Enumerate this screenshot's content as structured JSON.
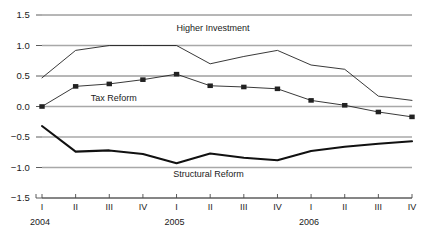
{
  "chart_data": {
    "type": "line",
    "title": "",
    "xlabel": "",
    "ylabel": "",
    "ylim": [
      -1.5,
      1.5
    ],
    "yticks": [
      "1.5",
      "1.0",
      "0.5",
      "0.0",
      "−0.5",
      "−1.0",
      "−1.5"
    ],
    "ytick_values": [
      1.5,
      1.0,
      0.5,
      0.0,
      -0.5,
      -1.0,
      -1.5
    ],
    "grid": true,
    "legend_position": "inline-annotations",
    "categories": [
      "I",
      "II",
      "III",
      "IV",
      "I",
      "II",
      "III",
      "IV",
      "I",
      "II",
      "III",
      "IV"
    ],
    "year_groups": [
      {
        "year": "2004",
        "start_index": 0,
        "end_index": 3
      },
      {
        "year": "2005",
        "start_index": 4,
        "end_index": 7
      },
      {
        "year": "2006",
        "start_index": 8,
        "end_index": 11
      }
    ],
    "series": [
      {
        "name": "Higher Investment",
        "style": "thin-line",
        "markers": false,
        "color": "#222222",
        "values": [
          0.47,
          0.92,
          1.0,
          1.0,
          1.0,
          0.7,
          0.82,
          0.92,
          0.68,
          0.61,
          0.17,
          0.1
        ]
      },
      {
        "name": "Tax Reform",
        "style": "thin-line-with-square-markers",
        "markers": true,
        "color": "#222222",
        "values": [
          0.0,
          0.33,
          0.37,
          0.44,
          0.53,
          0.34,
          0.32,
          0.29,
          0.1,
          0.02,
          -0.09,
          -0.17
        ]
      },
      {
        "name": "Structural Reform",
        "style": "thick-line",
        "markers": false,
        "color": "#111111",
        "values": [
          -0.32,
          -0.74,
          -0.72,
          -0.78,
          -0.93,
          -0.77,
          -0.84,
          -0.88,
          -0.73,
          -0.66,
          -0.61,
          -0.57
        ]
      }
    ],
    "annotations": [
      {
        "text": "Higher Investment",
        "x_index": 4.0,
        "y": 1.27
      },
      {
        "text": "Tax Reform",
        "x_index": 1.45,
        "y": 0.13
      },
      {
        "text": "Structural Reform",
        "x_index": 3.9,
        "y": -1.12
      }
    ]
  }
}
